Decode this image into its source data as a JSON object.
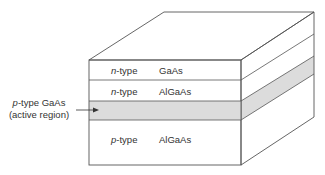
{
  "diagram": {
    "type": "semiconductor-heterostructure-block",
    "layers": [
      {
        "doping_prefix": "n",
        "doping_suffix": "-type",
        "material": "GaAs",
        "shaded": false
      },
      {
        "doping_prefix": "n",
        "doping_suffix": "-type",
        "material": "AlGaAs",
        "shaded": false
      },
      {
        "doping_prefix": "",
        "doping_suffix": "",
        "material": "",
        "shaded": true
      },
      {
        "doping_prefix": "p",
        "doping_suffix": "-type",
        "material": "AlGaAs",
        "shaded": false
      }
    ],
    "callout": {
      "line1_prefix": "p",
      "line1_suffix": "-type GaAs",
      "line2": "(active region)",
      "points_to": "active layer"
    },
    "colors": {
      "line": "#555555",
      "active_fill": "#dcdcdc",
      "background": "#ffffff"
    }
  }
}
